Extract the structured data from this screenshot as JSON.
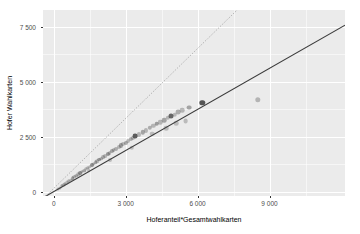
{
  "chart_data": {
    "type": "scatter",
    "title": "",
    "xlabel": "Hoferanteil*Gesamtwahlkarten",
    "ylabel": "Hofer Wahlkarten",
    "xlim": [
      -450,
      12150
    ],
    "ylim": [
      -200,
      8250
    ],
    "xticks": [
      0,
      3000,
      6000,
      9000
    ],
    "xticklabels": [
      "0",
      "3 000",
      "6 000",
      "9 000"
    ],
    "yticks": [
      0,
      2500,
      5000,
      7500
    ],
    "yticklabels": [
      "0",
      "2 500",
      "5 000",
      "7 500"
    ],
    "grid": true,
    "legend": "none",
    "panel_color": "#ebebeb",
    "grid_color": "#ffffff",
    "series": [
      {
        "name": "Bezirke",
        "marker": "circle",
        "color": "#4d4d4d",
        "points": [
          {
            "x": 160,
            "y": 120,
            "alpha": 0.35,
            "r": 1.6
          },
          {
            "x": 240,
            "y": 180,
            "alpha": 0.35,
            "r": 1.6
          },
          {
            "x": 320,
            "y": 250,
            "alpha": 0.4,
            "r": 1.7
          },
          {
            "x": 400,
            "y": 300,
            "alpha": 0.35,
            "r": 1.6
          },
          {
            "x": 470,
            "y": 360,
            "alpha": 0.45,
            "r": 1.7
          },
          {
            "x": 540,
            "y": 420,
            "alpha": 0.35,
            "r": 1.6
          },
          {
            "x": 620,
            "y": 470,
            "alpha": 0.4,
            "r": 1.7
          },
          {
            "x": 700,
            "y": 540,
            "alpha": 0.35,
            "r": 1.6
          },
          {
            "x": 780,
            "y": 600,
            "alpha": 0.5,
            "r": 1.8
          },
          {
            "x": 860,
            "y": 660,
            "alpha": 0.35,
            "r": 1.7
          },
          {
            "x": 940,
            "y": 720,
            "alpha": 0.4,
            "r": 1.7
          },
          {
            "x": 1020,
            "y": 780,
            "alpha": 0.35,
            "r": 1.7
          },
          {
            "x": 1100,
            "y": 850,
            "alpha": 0.55,
            "r": 1.9
          },
          {
            "x": 1180,
            "y": 900,
            "alpha": 0.35,
            "r": 1.7
          },
          {
            "x": 1260,
            "y": 960,
            "alpha": 0.45,
            "r": 1.8
          },
          {
            "x": 1340,
            "y": 1020,
            "alpha": 0.35,
            "r": 1.7
          },
          {
            "x": 1420,
            "y": 1090,
            "alpha": 0.4,
            "r": 1.8
          },
          {
            "x": 1500,
            "y": 1140,
            "alpha": 0.35,
            "r": 1.7
          },
          {
            "x": 1580,
            "y": 1210,
            "alpha": 0.6,
            "r": 2.0
          },
          {
            "x": 1660,
            "y": 1260,
            "alpha": 0.35,
            "r": 1.8
          },
          {
            "x": 1740,
            "y": 1330,
            "alpha": 0.45,
            "r": 1.8
          },
          {
            "x": 1820,
            "y": 1380,
            "alpha": 0.35,
            "r": 1.8
          },
          {
            "x": 1900,
            "y": 1450,
            "alpha": 0.5,
            "r": 1.9
          },
          {
            "x": 1980,
            "y": 1500,
            "alpha": 0.35,
            "r": 1.8
          },
          {
            "x": 2060,
            "y": 1560,
            "alpha": 0.4,
            "r": 1.9
          },
          {
            "x": 2150,
            "y": 1620,
            "alpha": 0.35,
            "r": 1.9
          },
          {
            "x": 2240,
            "y": 1700,
            "alpha": 0.55,
            "r": 2.0
          },
          {
            "x": 2330,
            "y": 1760,
            "alpha": 0.35,
            "r": 1.9
          },
          {
            "x": 2420,
            "y": 1830,
            "alpha": 0.45,
            "r": 2.0
          },
          {
            "x": 2500,
            "y": 1880,
            "alpha": 0.35,
            "r": 1.9
          },
          {
            "x": 2600,
            "y": 1950,
            "alpha": 0.4,
            "r": 2.0
          },
          {
            "x": 2700,
            "y": 2020,
            "alpha": 0.35,
            "r": 2.0
          },
          {
            "x": 2800,
            "y": 2100,
            "alpha": 0.5,
            "r": 2.1
          },
          {
            "x": 2900,
            "y": 2160,
            "alpha": 0.35,
            "r": 2.0
          },
          {
            "x": 3000,
            "y": 2230,
            "alpha": 0.45,
            "r": 2.1
          },
          {
            "x": 3100,
            "y": 2300,
            "alpha": 0.35,
            "r": 2.0
          },
          {
            "x": 3200,
            "y": 2380,
            "alpha": 0.4,
            "r": 2.1
          },
          {
            "x": 3300,
            "y": 2450,
            "alpha": 0.35,
            "r": 2.1
          },
          {
            "x": 3400,
            "y": 2520,
            "alpha": 0.9,
            "r": 2.4
          },
          {
            "x": 3250,
            "y": 1980,
            "alpha": 0.3,
            "r": 2.2
          },
          {
            "x": 3550,
            "y": 2600,
            "alpha": 0.35,
            "r": 2.1
          },
          {
            "x": 3700,
            "y": 2700,
            "alpha": 0.45,
            "r": 2.2
          },
          {
            "x": 3850,
            "y": 2780,
            "alpha": 0.35,
            "r": 2.1
          },
          {
            "x": 4000,
            "y": 2900,
            "alpha": 0.4,
            "r": 2.2
          },
          {
            "x": 4150,
            "y": 2980,
            "alpha": 0.35,
            "r": 2.2
          },
          {
            "x": 4300,
            "y": 3080,
            "alpha": 0.5,
            "r": 2.3
          },
          {
            "x": 4100,
            "y": 2620,
            "alpha": 0.3,
            "r": 2.3
          },
          {
            "x": 4450,
            "y": 3150,
            "alpha": 0.35,
            "r": 2.2
          },
          {
            "x": 4600,
            "y": 3250,
            "alpha": 0.45,
            "r": 2.3
          },
          {
            "x": 4750,
            "y": 3340,
            "alpha": 0.35,
            "r": 2.2
          },
          {
            "x": 4900,
            "y": 3420,
            "alpha": 0.85,
            "r": 2.5
          },
          {
            "x": 4700,
            "y": 2880,
            "alpha": 0.3,
            "r": 2.3
          },
          {
            "x": 5050,
            "y": 3500,
            "alpha": 0.35,
            "r": 2.3
          },
          {
            "x": 5200,
            "y": 3620,
            "alpha": 0.4,
            "r": 2.4
          },
          {
            "x": 5350,
            "y": 3700,
            "alpha": 0.35,
            "r": 2.3
          },
          {
            "x": 5500,
            "y": 3200,
            "alpha": 0.3,
            "r": 2.4
          },
          {
            "x": 5650,
            "y": 3820,
            "alpha": 0.45,
            "r": 2.4
          },
          {
            "x": 6200,
            "y": 4020,
            "alpha": 0.95,
            "r": 2.7
          },
          {
            "x": 8500,
            "y": 4180,
            "alpha": 0.35,
            "r": 2.7
          },
          {
            "x": 5100,
            "y": 3100,
            "alpha": 0.3,
            "r": 2.3
          },
          {
            "x": 2350,
            "y": 1450,
            "alpha": 0.3,
            "r": 2.0
          },
          {
            "x": 1450,
            "y": 980,
            "alpha": 0.3,
            "r": 1.8
          }
        ]
      }
    ],
    "lines": [
      {
        "name": "regression-line",
        "style": "solid",
        "color": "#3a3a3a",
        "width": 1.1,
        "x0": -450,
        "y0": -280,
        "x1": 12150,
        "y1": 7560
      },
      {
        "name": "reference-line",
        "style": "dotted",
        "color": "#9a9a9a",
        "width": 0.9,
        "x0": -450,
        "y0": -330,
        "x1": 7650,
        "y1": 8250
      }
    ]
  }
}
